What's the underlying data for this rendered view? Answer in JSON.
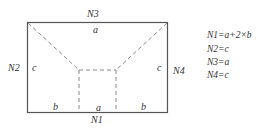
{
  "diagram": {
    "nodes": {
      "top": "N3",
      "left": "N2",
      "right": "N4",
      "bottom": "N1"
    },
    "edge_labels": {
      "top_inner": "a",
      "left_inner": "c",
      "right_inner": "c",
      "bottom_left": "b",
      "bottom_center": "a",
      "bottom_right": "b"
    },
    "equations": [
      "N1=a+2×b",
      "N2=c",
      "N3=a",
      "N4=c"
    ],
    "colors": {
      "outline": "#555555",
      "dashed": "#888888",
      "text": "#333333"
    }
  }
}
